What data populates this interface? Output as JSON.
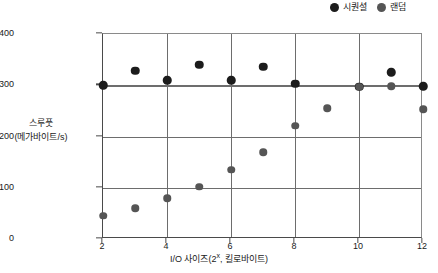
{
  "chart_data": {
    "type": "scatter",
    "title": "",
    "xlabel": "I/O 사이즈(2ˣ, 킬로바이트)",
    "xlabel_base": "I/O 사이즈(2",
    "xlabel_exp": "x",
    "xlabel_tail": ", 킬로바이트)",
    "ylabel_line1": "스루풋",
    "ylabel_line2": "(메가바이트/s)",
    "xlim": [
      2,
      12
    ],
    "ylim": [
      0,
      400
    ],
    "xticks": [
      2,
      4,
      6,
      8,
      10,
      12
    ],
    "yticks": [
      0,
      100,
      200,
      300,
      400
    ],
    "grid": "both",
    "legend_position": "top-right",
    "x": [
      2,
      3,
      4,
      5,
      6,
      7,
      8,
      9,
      10,
      11,
      12
    ],
    "series": [
      {
        "name": "시퀀셜",
        "color": "#1c1c1c",
        "marker": "circle",
        "values": [
          300,
          328,
          310,
          340,
          310,
          336,
          303,
          null,
          297,
          325,
          298
        ]
      },
      {
        "name": "랜덤",
        "color": "#555555",
        "marker": "circle",
        "values": [
          45,
          60,
          80,
          102,
          135,
          169,
          221,
          255,
          297,
          298,
          253
        ]
      }
    ]
  },
  "legend": {
    "entries": [
      {
        "label": "시퀀셜",
        "color": "#1c1c1c"
      },
      {
        "label": "랜덤",
        "color": "#555555"
      }
    ]
  }
}
